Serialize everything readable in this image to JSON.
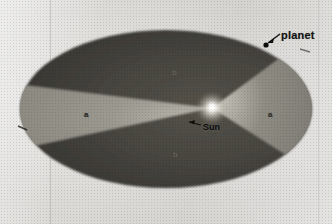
{
  "figure": {
    "background_color": "#e3e2df",
    "labels": {
      "planet": "planet",
      "sun": "Sun",
      "area_left": "a",
      "area_right": "a",
      "area_top": "b",
      "area_bottom": "b"
    },
    "colors": {
      "orbit_dark": "#4a4843",
      "orbit_darker": "#3c3a36",
      "sector_light": "#9b9890",
      "sun_glow": "#f2f0ea",
      "ink": "#141414",
      "paper": "#e3e2df"
    },
    "geometry": {
      "ellipse_center_x": 166,
      "ellipse_center_y": 109,
      "ellipse_radius_x": 146,
      "ellipse_radius_y": 79,
      "sun_x": 212,
      "sun_y": 108,
      "planet_dot_x": 266,
      "planet_dot_y": 45
    },
    "annotations": [
      {
        "name": "planet-arrow",
        "from_x": 281,
        "from_y": 34,
        "to_x": 268,
        "to_y": 44
      },
      {
        "name": "sun-leader",
        "from_x": 202,
        "from_y": 126,
        "to_x": 188,
        "to_y": 123
      }
    ]
  }
}
